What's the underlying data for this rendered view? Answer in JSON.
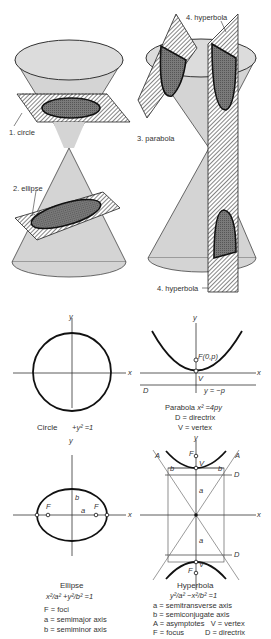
{
  "cones": {
    "labels": {
      "circle": "1. circle",
      "ellipse": "2. ellipse",
      "parabola": "3. parabola",
      "hyperbola_top": "4. hyperbola",
      "hyperbola_bottom": "4. hyperbola"
    }
  },
  "circle": {
    "axis_x": "x",
    "axis_y": "y",
    "caption_name": "Circle",
    "caption_eq": "+y² =1"
  },
  "parabola": {
    "axis_x": "x",
    "axis_y": "y",
    "focus_label": "F(0,p)",
    "vertex_label": "V",
    "directrix_label": "D",
    "directrix_eq": "y = −p",
    "caption_name": "Parabola",
    "caption_eq": "x² =4py",
    "legend": [
      "D = directrix",
      "V = vertex"
    ]
  },
  "ellipse": {
    "axis_x": "x",
    "axis_y": "y",
    "focus_left": "F",
    "focus_right": "F",
    "semi_minor": "b",
    "semi_major": "a",
    "caption_name": "Ellipse",
    "caption_eq": "x²/a² +y²/b² =1",
    "legend": [
      "F = foci",
      "a = semimajor axis",
      "b = semiminor axis"
    ]
  },
  "hyperbola": {
    "axis_x": "x",
    "axis_y": "y",
    "asymptote_labels": [
      "A",
      "A"
    ],
    "b_labels": [
      "b",
      "b"
    ],
    "a_labels": [
      "a",
      "a"
    ],
    "directrix_labels": [
      "D",
      "D"
    ],
    "focus_top": "F",
    "focus_bottom": "F",
    "vertex_top": "V",
    "vertex_bottom": "V",
    "caption_name": "Hyperbola",
    "caption_eq": "y²/a² −x²/b² =1",
    "legend": [
      "a = semitransverse axis",
      "b = semiconjugate axis",
      "A = asymptotes   V = vertex",
      "F = focus          D = directrix"
    ]
  },
  "colors": {
    "cone_fill": "#d2d2d2",
    "section_fill": "#6e6e6e",
    "line": "#2a2a2a"
  }
}
